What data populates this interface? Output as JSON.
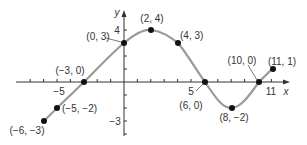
{
  "chart_data": {
    "type": "line",
    "title": "",
    "xlabel": "x",
    "ylabel": "y",
    "xlim": [
      -7,
      12
    ],
    "ylim": [
      -4,
      5
    ],
    "grid": false,
    "legend": null,
    "series": [
      {
        "name": "f(x)",
        "points": [
          [
            -6,
            -3
          ],
          [
            -5,
            -2
          ],
          [
            -3,
            0
          ],
          [
            0,
            3
          ],
          [
            2,
            4
          ],
          [
            4,
            3
          ],
          [
            6,
            0
          ],
          [
            8,
            -2
          ],
          [
            10,
            0
          ],
          [
            11,
            1
          ]
        ]
      }
    ],
    "tick_labels": {
      "x": [
        "-5",
        "5",
        "11"
      ],
      "y": [
        "4",
        "-3"
      ]
    },
    "annotations": [
      {
        "point": [
          -6,
          -3
        ],
        "label": "(−6, −3)"
      },
      {
        "point": [
          -5,
          -2
        ],
        "label": "(−5, −2)"
      },
      {
        "point": [
          -3,
          0
        ],
        "label": "(−3, 0)"
      },
      {
        "point": [
          0,
          3
        ],
        "label": "(0, 3)"
      },
      {
        "point": [
          2,
          4
        ],
        "label": "(2, 4)"
      },
      {
        "point": [
          4,
          3
        ],
        "label": "(4, 3)"
      },
      {
        "point": [
          6,
          0
        ],
        "label": "(6, 0)"
      },
      {
        "point": [
          8,
          -2
        ],
        "label": "(8, −2)"
      },
      {
        "point": [
          10,
          0
        ],
        "label": "(10, 0)"
      },
      {
        "point": [
          11,
          1
        ],
        "label": "(11, 1)"
      }
    ]
  },
  "style": {
    "curve_color": "#9a9a9a",
    "axis_color": "#333333",
    "point_color": "#111111"
  }
}
